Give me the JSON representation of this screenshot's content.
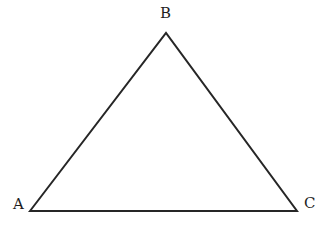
{
  "figure": {
    "name": "triangle-abc",
    "caption": "",
    "background_color": "#ffffff",
    "width": 334,
    "height": 230
  },
  "style": {
    "stroke_color": "#262626",
    "stroke_width": 2,
    "label_color": "#1f1f1f",
    "label_font_size": 15
  },
  "shape": {
    "type": "triangle",
    "fill": "none",
    "points": "30,211 166,33 297,211"
  },
  "vertices": [
    {
      "id": "A",
      "label": "A",
      "x": 30,
      "y": 211,
      "label_x": 13,
      "label_y": 197
    },
    {
      "id": "B",
      "label": "B",
      "x": 166,
      "y": 33,
      "label_x": 160,
      "label_y": 6
    },
    {
      "id": "C",
      "label": "C",
      "x": 297,
      "y": 211,
      "label_x": 304,
      "label_y": 196
    }
  ],
  "edges": [
    {
      "id": "AB",
      "from": "A",
      "to": "B",
      "label": ""
    },
    {
      "id": "BC",
      "from": "B",
      "to": "C",
      "label": ""
    },
    {
      "id": "CA",
      "from": "C",
      "to": "A",
      "label": ""
    }
  ]
}
